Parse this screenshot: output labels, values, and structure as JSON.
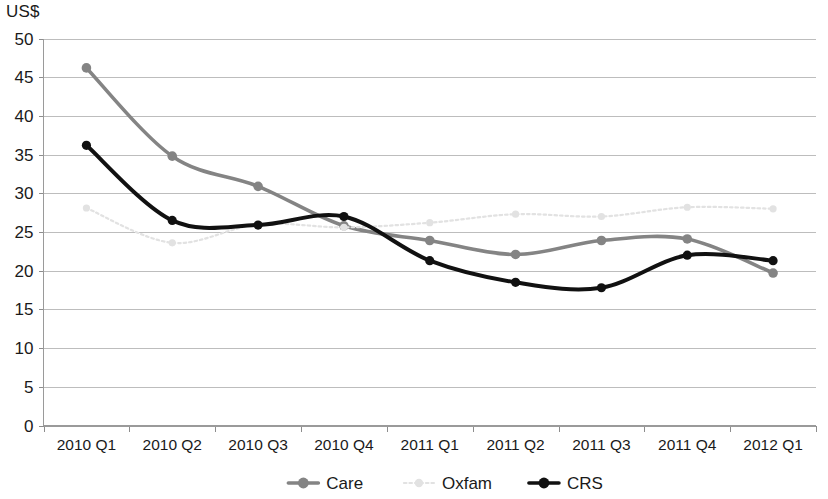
{
  "chart_data": {
    "type": "line",
    "title": "",
    "subtitle": "",
    "xlabel": "",
    "ylabel": "US$",
    "ylim": [
      0,
      50
    ],
    "ytick_step": 5,
    "yticks": [
      "0",
      "5",
      "10",
      "15",
      "20",
      "25",
      "30",
      "35",
      "40",
      "45",
      "50"
    ],
    "grid": "horizontal",
    "legend_position": "bottom",
    "categories": [
      "2010 Q1",
      "2010 Q2",
      "2010 Q3",
      "2010 Q4",
      "2011 Q1",
      "2011 Q2",
      "2011 Q3",
      "2011 Q4",
      "2012 Q1"
    ],
    "series": [
      {
        "name": "Care",
        "color": "#848484",
        "marker": "circle",
        "linestyle": "solid",
        "values": [
          46.2,
          34.8,
          30.9,
          25.8,
          23.9,
          22.1,
          23.9,
          24.1,
          19.7
        ]
      },
      {
        "name": "Oxfam",
        "color": "#e2e2e2",
        "marker": "circle",
        "linestyle": "dotted",
        "values": [
          28.1,
          23.6,
          26.0,
          25.6,
          26.2,
          27.3,
          27.0,
          28.2,
          28.0
        ]
      },
      {
        "name": "CRS",
        "color": "#111111",
        "marker": "circle",
        "linestyle": "solid",
        "values": [
          36.2,
          26.5,
          25.9,
          27.0,
          21.3,
          18.5,
          17.8,
          22.0,
          21.3
        ]
      }
    ]
  },
  "legend": {
    "items": [
      {
        "label": "Care",
        "color": "#848484"
      },
      {
        "label": "Oxfam",
        "color": "#e2e2e2"
      },
      {
        "label": "CRS",
        "color": "#111111"
      }
    ]
  },
  "axis": {
    "unit_label": "US$"
  }
}
